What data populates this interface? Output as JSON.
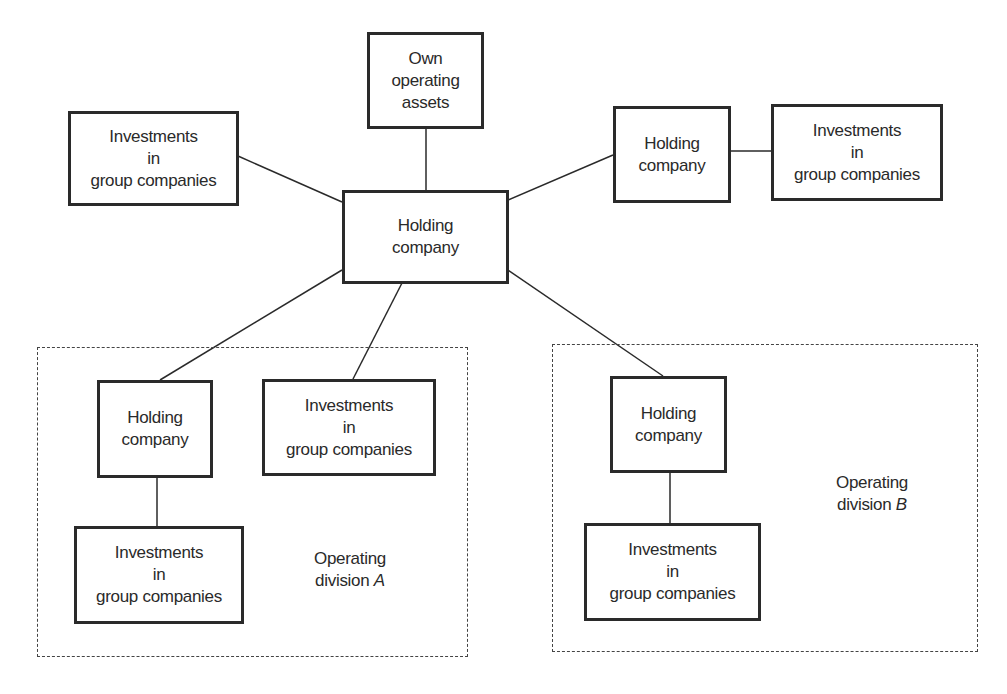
{
  "diagram": {
    "nodes": {
      "central_holding": {
        "line1": "Holding",
        "line2": "company"
      },
      "own_assets": {
        "line1": "Own",
        "line2": "operating",
        "line3": "assets"
      },
      "left_investments": {
        "line1": "Investments",
        "line2": "in",
        "line3": "group companies"
      },
      "right_holding": {
        "line1": "Holding",
        "line2": "company"
      },
      "right_investments": {
        "line1": "Investments",
        "line2": "in",
        "line3": "group companies"
      },
      "divA_holding": {
        "line1": "Holding",
        "line2": "company"
      },
      "divA_investments_top": {
        "line1": "Investments",
        "line2": "in",
        "line3": "group companies"
      },
      "divA_investments_bottom": {
        "line1": "Investments",
        "line2": "in",
        "line3": "group companies"
      },
      "divB_holding": {
        "line1": "Holding",
        "line2": "company"
      },
      "divB_investments": {
        "line1": "Investments",
        "line2": "in",
        "line3": "group companies"
      }
    },
    "divisions": {
      "a": {
        "line1": "Operating",
        "line2_prefix": "division ",
        "letter": "A"
      },
      "b": {
        "line1": "Operating",
        "line2_prefix": "division ",
        "letter": "B"
      }
    }
  }
}
